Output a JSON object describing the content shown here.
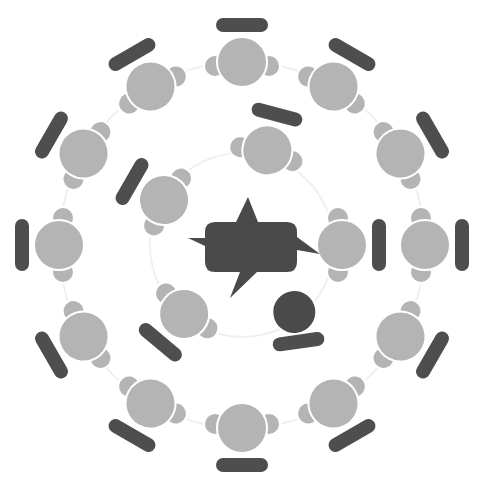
{
  "diagram": {
    "center": {
      "x": 242,
      "y": 245
    },
    "colors": {
      "background": "#ffffff",
      "person_light": "#b4b4b4",
      "person_dark": "#4a4a4a",
      "desk": "#4e4e4e",
      "speech_bubble": "#4a4a4a",
      "ring_line": "#f0f0f0"
    },
    "outer_ring": {
      "head_radius_px": 183,
      "desk_radius_px": 221,
      "angles_deg": [
        0,
        30,
        60,
        90,
        120,
        150,
        180,
        210,
        240,
        270,
        300,
        330
      ],
      "count": 12
    },
    "inner_ring": {
      "figures": [
        {
          "angle_deg": -75,
          "dist": 98,
          "style": "light"
        },
        {
          "angle_deg": -150,
          "dist": 90,
          "style": "light"
        },
        {
          "angle_deg": 0,
          "dist": 100,
          "style": "light"
        },
        {
          "angle_deg": 130,
          "dist": 90,
          "style": "light"
        },
        {
          "angle_deg": 52,
          "dist": 85,
          "style": "dark"
        }
      ]
    },
    "center_icon": "speech-bubble-icon"
  }
}
